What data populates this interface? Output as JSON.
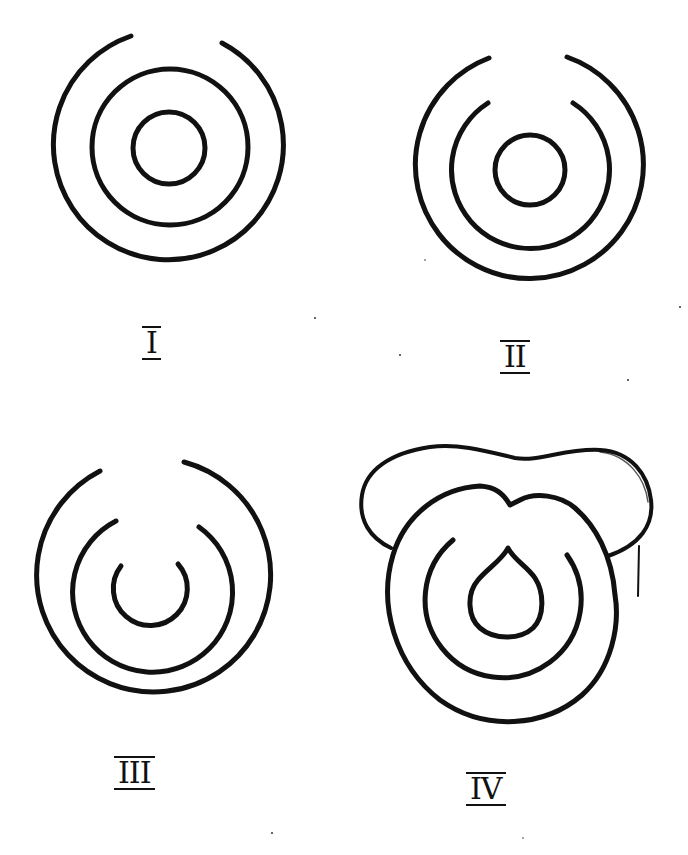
{
  "figures": [
    {
      "id": "I",
      "label": "I",
      "description": "Outer ring open at top; middle and inner rings closed"
    },
    {
      "id": "II",
      "label": "II",
      "description": "Outer and middle rings open at top; inner ring closed"
    },
    {
      "id": "III",
      "label": "III",
      "description": "All three rings open at top"
    },
    {
      "id": "IV",
      "label": "IV",
      "description": "Rings with cap-shaped outline above; outer ring dented at top, inner ring teardrop-shaped"
    }
  ],
  "colors": {
    "ink": "#111111",
    "paper": "#ffffff"
  }
}
